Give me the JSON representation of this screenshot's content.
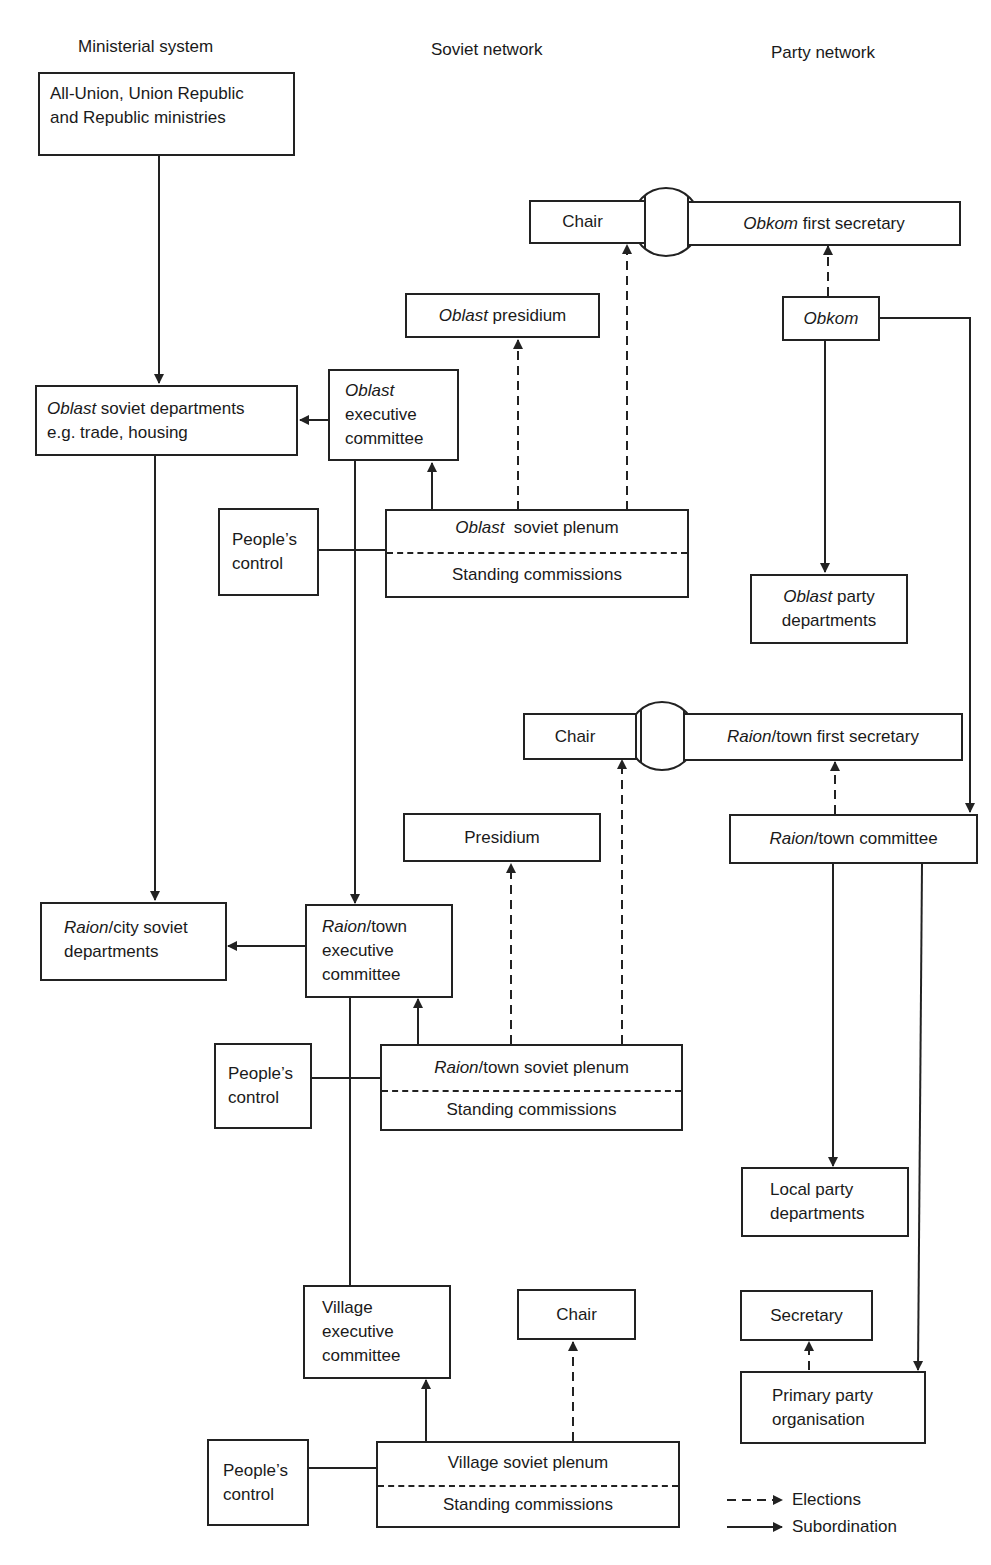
{
  "columns": {
    "ministerial": "Ministerial system",
    "soviet": "Soviet network",
    "party": "Party network"
  },
  "ministerial": {
    "ministries": {
      "line1": "All-Union, Union Republic",
      "line2": "and Republic ministries"
    },
    "oblast_depts": {
      "italic": "Oblast",
      "line1_rest": " soviet departments",
      "line2": "e.g. trade, housing"
    },
    "raion_depts": {
      "italic": "Raion",
      "line1_rest": "/city soviet",
      "line2": "departments"
    }
  },
  "soviet": {
    "oblast_chair": "Chair",
    "oblast_presidium": {
      "italic": "Oblast",
      "rest": " presidium"
    },
    "oblast_exec": {
      "italic": "Oblast",
      "line2": "executive",
      "line3": "committee"
    },
    "oblast_peoples_control": {
      "line1": "People’s",
      "line2": "control"
    },
    "oblast_plenum": {
      "italic": "Oblast",
      "rest": "  soviet plenum",
      "lower": "Standing commissions"
    },
    "raion_chair": "Chair",
    "raion_presidium": "Presidium",
    "raion_exec": {
      "italic": "Raion",
      "line1_rest": "/town",
      "line2": "executive",
      "line3": "committee"
    },
    "raion_peoples_control": {
      "line1": "People’s",
      "line2": "control"
    },
    "raion_plenum": {
      "italic": "Raion",
      "rest": "/town soviet plenum",
      "lower": "Standing commissions"
    },
    "village_exec": {
      "line1": "Village",
      "line2": "executive",
      "line3": "committee"
    },
    "village_chair": "Chair",
    "village_peoples_control": {
      "line1": "People’s",
      "line2": "control"
    },
    "village_plenum": {
      "upper": "Village soviet plenum",
      "lower": "Standing commissions"
    }
  },
  "party": {
    "obkom_first_secretary": {
      "italic": "Obkom",
      "rest": " first secretary"
    },
    "obkom": "Obkom",
    "oblast_party_depts": {
      "italic": "Oblast",
      "line1_rest": " party",
      "line2": "departments"
    },
    "raion_first_secretary": {
      "italic": "Raion",
      "rest": "/town first secretary"
    },
    "raion_committee": {
      "italic": "Raion",
      "rest": "/town committee"
    },
    "local_party_depts": {
      "line1": "Local party",
      "line2": "departments"
    },
    "secretary": "Secretary",
    "primary_party_org": {
      "line1": "Primary party",
      "line2": "organisation"
    }
  },
  "legend": {
    "elections": "Elections",
    "subordination": "Subordination"
  },
  "colors": {
    "line": "#222222",
    "background": "#ffffff"
  }
}
